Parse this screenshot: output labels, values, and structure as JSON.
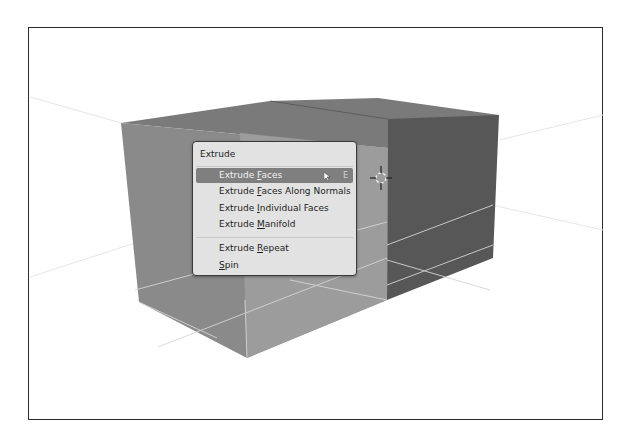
{
  "viewport": {
    "background": "#ffffff",
    "frame_color": "#2a2a2a",
    "object": "cube-extruded",
    "colors": {
      "front_face": "#8a8a8a",
      "front_selected": "#9c9c9c",
      "top_face": "#7a7a7a",
      "right_face": "#575757",
      "grid_line": "#d9d9d9"
    }
  },
  "menu": {
    "title": "Extrude",
    "items": [
      {
        "pre": "Extrude ",
        "u": "F",
        "post": "aces",
        "shortcut": "E",
        "active": true
      },
      {
        "pre": "Extrude ",
        "u": "F",
        "post": "aces Along Normals",
        "shortcut": "",
        "active": false
      },
      {
        "pre": "Extrude ",
        "u": "I",
        "post": "ndividual Faces",
        "shortcut": "",
        "active": false
      },
      {
        "pre": "Extrude ",
        "u": "M",
        "post": "anifold",
        "shortcut": "",
        "active": false
      },
      {
        "pre": "Extrude ",
        "u": "R",
        "post": "epeat",
        "shortcut": "",
        "active": false
      },
      {
        "pre": "",
        "u": "S",
        "post": "pin",
        "shortcut": "",
        "active": false
      }
    ],
    "colors": {
      "bg": "#e2e2e2",
      "highlight": "#7f7f7f",
      "text": "#1d1d1d"
    }
  },
  "cursor3d": {
    "name": "3d-cursor"
  }
}
